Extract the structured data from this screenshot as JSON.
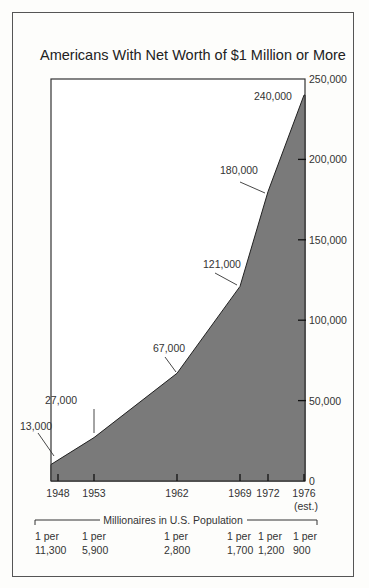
{
  "chart_data": {
    "type": "area",
    "title": "Americans With Net Worth of $1 Million or More",
    "xlabel": "",
    "ylabel": "",
    "x": [
      1948,
      1953,
      1962,
      1969,
      1972,
      1976
    ],
    "x_tick_labels": [
      "1948",
      "1953",
      "1962",
      "1969",
      "1972",
      "1976\n(est.)"
    ],
    "series": [
      {
        "name": "Millionaires",
        "values": [
          13000,
          27000,
          67000,
          121000,
          180000,
          240000
        ]
      }
    ],
    "data_labels": [
      "13,000",
      "27,000",
      "67,000",
      "121,000",
      "180,000",
      "240,000"
    ],
    "y_ticks": [
      0,
      50000,
      100000,
      150000,
      200000,
      250000
    ],
    "y_tick_labels": [
      "0",
      "50,000",
      "100,000",
      "150,000",
      "200,000",
      "250,000"
    ],
    "ylim": [
      0,
      250000
    ],
    "y_axis_position": "right",
    "grid": false,
    "fill_color": "#7a7a7a",
    "annotation": {
      "title": "Millionaires in U.S. Population",
      "ratios": [
        "1 per 11,300",
        "1 per 5,900",
        "1 per 2,800",
        "1 per 1,700",
        "1 per 1,200",
        "1 per 900"
      ]
    }
  },
  "title": "Americans With Net Worth of $1 Million or More",
  "population": {
    "heading": "Millionaires in U.S. Population",
    "items": [
      {
        "line1": "1 per",
        "line2": "11,300"
      },
      {
        "line1": "1 per",
        "line2": "5,900"
      },
      {
        "line1": "1 per",
        "line2": "2,800"
      },
      {
        "line1": "1 per",
        "line2": "1,700"
      },
      {
        "line1": "1 per",
        "line2": "1,200"
      },
      {
        "line1": "1 per",
        "line2": "900"
      }
    ]
  },
  "est_note": "(est.)"
}
